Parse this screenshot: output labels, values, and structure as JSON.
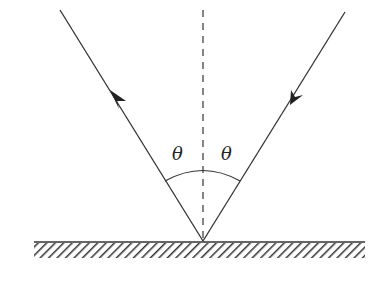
{
  "diagram": {
    "labels": {
      "angle_incident": "θ",
      "angle_reflected": "θ"
    },
    "colors": {
      "line": "#333333",
      "background": "#ffffff"
    },
    "elements": [
      {
        "name": "incident-ray",
        "direction": "toward surface"
      },
      {
        "name": "reflected-ray",
        "direction": "away from surface"
      },
      {
        "name": "normal-line",
        "style": "dashed"
      },
      {
        "name": "angle-arc"
      },
      {
        "name": "reflecting-surface",
        "style": "hatched"
      }
    ]
  }
}
